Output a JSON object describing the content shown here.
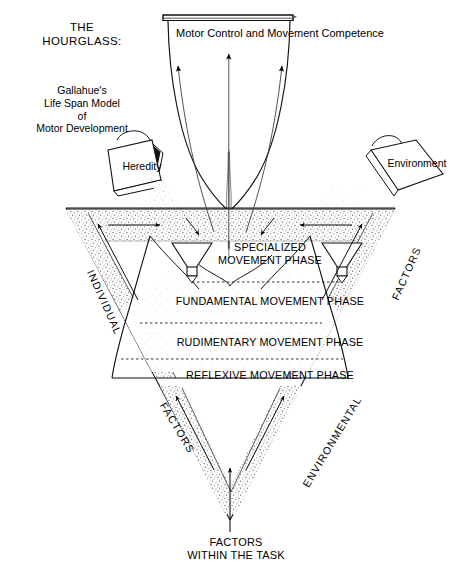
{
  "figure": {
    "title_main": "THE\nHOURGLASS:",
    "title_sub": "Gallahue's\nLife Span Model\nof\nMotor Development",
    "top_label": "Motor Control and Movement Competence",
    "bottom_label": "FACTORS\nWITHIN THE TASK"
  },
  "inputs": [
    {
      "id": "heredity",
      "label": "Heredity",
      "side": "left"
    },
    {
      "id": "environment",
      "label": "Environment",
      "side": "right"
    }
  ],
  "phases": [
    {
      "id": "specialized",
      "label": "SPECIALIZED\nMOVEMENT PHASE"
    },
    {
      "id": "fundamental",
      "label": "FUNDAMENTAL MOVEMENT PHASE"
    },
    {
      "id": "rudimentary",
      "label": "RUDIMENTARY MOVEMENT PHASE"
    },
    {
      "id": "reflexive",
      "label": "REFLEXIVE MOVEMENT PHASE"
    }
  ],
  "diagonal_labels": {
    "upper_left": "INDIVIDUAL",
    "upper_right": "FACTORS",
    "lower_left": "FACTORS",
    "lower_right": "ENVIRONMENTAL"
  },
  "colors": {
    "ink": "#000000",
    "background": "#ffffff",
    "stipple": "#7a7a7a",
    "thin_line": "#3a3a3a"
  }
}
